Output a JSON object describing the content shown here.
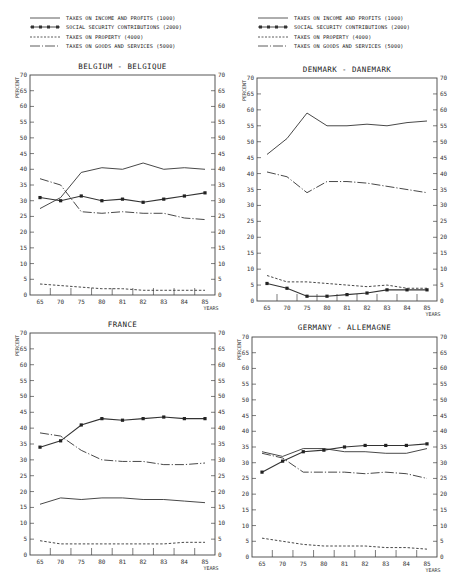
{
  "legend": {
    "items": [
      {
        "key": "income",
        "label": "TAXES ON INCOME AND PROFITS (1000)",
        "style": "solid"
      },
      {
        "key": "social",
        "label": "SOCIAL SECURITY CONTRIBUTIONS (2000)",
        "style": "solid-square"
      },
      {
        "key": "property",
        "label": "TAXES ON PROPERTY (4000)",
        "style": "dashed"
      },
      {
        "key": "goods",
        "label": "TAXES ON GOODS AND SERVICES (5000)",
        "style": "dash-dot"
      }
    ]
  },
  "chart_data": [
    {
      "type": "line",
      "title": "BELGIUM - BELGIQUE",
      "xlabel": "YEARS",
      "ylabel": "PERCENT",
      "ylim": [
        0,
        70
      ],
      "yticks": [
        0,
        5,
        10,
        15,
        20,
        25,
        30,
        35,
        40,
        45,
        50,
        55,
        60,
        65,
        70
      ],
      "categories": [
        "65",
        "70",
        "75",
        "80",
        "81",
        "82",
        "83",
        "84",
        "85"
      ],
      "series": [
        {
          "name": "TAXES ON INCOME AND PROFITS (1000)",
          "values": [
            27.5,
            31,
            39,
            40.5,
            40,
            42,
            40,
            40.5,
            40
          ]
        },
        {
          "name": "SOCIAL SECURITY CONTRIBUTIONS (2000)",
          "values": [
            31,
            30,
            31.5,
            30,
            30.5,
            29.5,
            30.5,
            31.5,
            32.5
          ]
        },
        {
          "name": "TAXES ON PROPERTY (4000)",
          "values": [
            3.5,
            3,
            2.5,
            2,
            2,
            1.5,
            1.5,
            1.5,
            1.5
          ]
        },
        {
          "name": "TAXES ON GOODS AND SERVICES (5000)",
          "values": [
            37,
            35,
            26.5,
            26,
            26.5,
            26,
            26,
            24.5,
            24
          ]
        }
      ]
    },
    {
      "type": "line",
      "title": "DENMARK - DANEMARK",
      "xlabel": "YEARS",
      "ylabel": "PERCENT",
      "ylim": [
        0,
        70
      ],
      "yticks": [
        0,
        5,
        10,
        15,
        20,
        25,
        30,
        35,
        40,
        45,
        50,
        55,
        60,
        65,
        70
      ],
      "categories": [
        "65",
        "70",
        "75",
        "80",
        "81",
        "82",
        "83",
        "84",
        "85"
      ],
      "series": [
        {
          "name": "TAXES ON INCOME AND PROFITS (1000)",
          "values": [
            46,
            51,
            59,
            55,
            55,
            55.5,
            55,
            56,
            56.5
          ]
        },
        {
          "name": "SOCIAL SECURITY CONTRIBUTIONS (2000)",
          "values": [
            5.5,
            4,
            1.5,
            1.5,
            2,
            2.5,
            3.5,
            3.5,
            3.5
          ]
        },
        {
          "name": "TAXES ON PROPERTY (4000)",
          "values": [
            8,
            6,
            6,
            5.5,
            5,
            4.5,
            5,
            4,
            4
          ]
        },
        {
          "name": "TAXES ON GOODS AND SERVICES (5000)",
          "values": [
            40.5,
            39,
            34,
            37.5,
            37.5,
            37,
            36,
            35,
            34
          ]
        }
      ]
    },
    {
      "type": "line",
      "title": "FRANCE",
      "xlabel": "YEARS",
      "ylabel": "PERCENT",
      "ylim": [
        0,
        70
      ],
      "yticks": [
        0,
        5,
        10,
        15,
        20,
        25,
        30,
        35,
        40,
        45,
        50,
        55,
        60,
        65,
        70
      ],
      "categories": [
        "65",
        "70",
        "75",
        "80",
        "81",
        "82",
        "83",
        "84",
        "85"
      ],
      "series": [
        {
          "name": "TAXES ON INCOME AND PROFITS (1000)",
          "values": [
            16,
            18,
            17.5,
            18,
            18,
            17.5,
            17.5,
            17,
            16.5
          ]
        },
        {
          "name": "SOCIAL SECURITY CONTRIBUTIONS (2000)",
          "values": [
            34,
            36,
            41,
            43,
            42.5,
            43,
            43.5,
            43,
            43
          ]
        },
        {
          "name": "TAXES ON PROPERTY (4000)",
          "values": [
            4.5,
            3.5,
            3.5,
            3.5,
            3.5,
            3.5,
            3.5,
            4,
            4
          ]
        },
        {
          "name": "TAXES ON GOODS AND SERVICES (5000)",
          "values": [
            38.5,
            37.5,
            33,
            30,
            29.5,
            29.5,
            28.5,
            28.5,
            29
          ]
        }
      ]
    },
    {
      "type": "line",
      "title": "GERMANY - ALLEMAGNE",
      "xlabel": "YEARS",
      "ylabel": "PERCENT",
      "ylim": [
        0,
        70
      ],
      "yticks": [
        0,
        5,
        10,
        15,
        20,
        25,
        30,
        35,
        40,
        45,
        50,
        55,
        60,
        65,
        70
      ],
      "categories": [
        "65",
        "70",
        "75",
        "80",
        "81",
        "82",
        "83",
        "84",
        "85"
      ],
      "series": [
        {
          "name": "TAXES ON INCOME AND PROFITS (1000)",
          "values": [
            33.5,
            32,
            34.5,
            34.5,
            33.5,
            33.5,
            33,
            33,
            34.5
          ]
        },
        {
          "name": "SOCIAL SECURITY CONTRIBUTIONS (2000)",
          "values": [
            27,
            30.5,
            33.5,
            34,
            35,
            35.5,
            35.5,
            35.5,
            36
          ]
        },
        {
          "name": "TAXES ON PROPERTY (4000)",
          "values": [
            6,
            5,
            4,
            3.5,
            3.5,
            3.5,
            3,
            3,
            2.5
          ]
        },
        {
          "name": "TAXES ON GOODS AND SERVICES (5000)",
          "values": [
            33,
            31.5,
            27,
            27,
            27,
            26.5,
            27,
            26.5,
            25
          ]
        }
      ]
    }
  ]
}
